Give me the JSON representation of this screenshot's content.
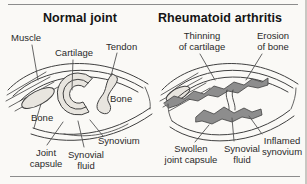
{
  "figure": {
    "colors": {
      "background": "#faf9f6",
      "outline": "#404040",
      "light_tissue_fill": "#e8e5df",
      "inflamed_fill": "#8d8d8d",
      "divider": "#8c8c8c"
    },
    "left_panel": {
      "title": "Normal joint",
      "labels": {
        "muscle": "Muscle",
        "cartilage": "Cartilage",
        "tendon": "Tendon",
        "bone_upper": "Bone",
        "bone_lower": "Bone",
        "joint_capsule": "Joint\ncapsule",
        "synovial_fluid": "Synovial\nfluid",
        "synovium": "Synovium"
      }
    },
    "right_panel": {
      "title": "Rheumatoid arthritis",
      "labels": {
        "thinning_of_cartilage": "Thinning\nof cartilage",
        "erosion_of_bone": "Erosion\nof bone",
        "swollen_joint_capsule": "Swollen\njoint capsule",
        "synovial_fluid": "Synovial\nfluid",
        "inflamed_synovium": "Inflamed\nsynovium"
      }
    }
  }
}
